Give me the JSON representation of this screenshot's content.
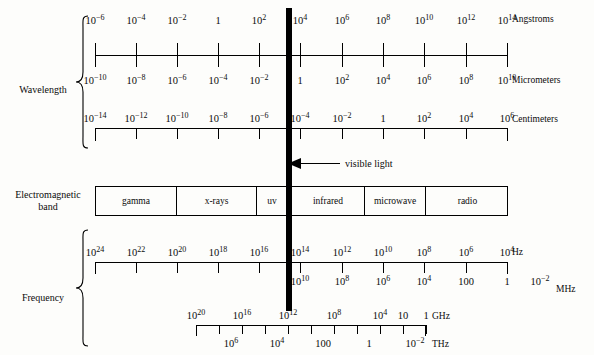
{
  "groups": {
    "wavelength_label": "Wavelength",
    "frequency_label": "Frequency",
    "band_label_line1": "Electromagnetic",
    "band_label_line2": "band"
  },
  "annotation": {
    "visible_light": "visible light",
    "arrow_icon": "left-arrow-icon"
  },
  "units": {
    "angstroms": "Angstroms",
    "micrometers": "Micrometers",
    "centimeters": "Centimeters",
    "hz": "Hz",
    "mhz": "MHz",
    "ghz": "GHz",
    "thz": "THz"
  },
  "scales": {
    "angstroms": {
      "unit": "Angstroms",
      "position": "above",
      "labels": [
        "10-6",
        "10-4",
        "10-2",
        "1",
        "102",
        "104",
        "106",
        "108",
        "1010",
        "1012",
        "1014"
      ],
      "exponents": [
        -6,
        -4,
        -2,
        0,
        2,
        4,
        6,
        8,
        10,
        12,
        14
      ]
    },
    "micrometers": {
      "unit": "Micrometers",
      "position": "below",
      "labels": [
        "10-10",
        "10-8",
        "10-6",
        "10-4",
        "10-2",
        "1",
        "102",
        "104",
        "106",
        "108",
        "1010"
      ],
      "exponents": [
        -10,
        -8,
        -6,
        -4,
        -2,
        0,
        2,
        4,
        6,
        8,
        10
      ]
    },
    "centimeters": {
      "unit": "Centimeters",
      "position": "above",
      "labels": [
        "10-14",
        "10-12",
        "10-10",
        "10-8",
        "10-6",
        "10-4",
        "10-2",
        "1",
        "102",
        "104",
        "106"
      ],
      "exponents": [
        -14,
        -12,
        -10,
        -8,
        -6,
        -4,
        -2,
        0,
        2,
        4,
        6
      ]
    },
    "hz": {
      "unit": "Hz",
      "position": "above",
      "labels": [
        "1024",
        "1022",
        "1020",
        "1018",
        "1016",
        "1014",
        "1012",
        "1010",
        "108",
        "106",
        "104"
      ],
      "exponents": [
        24,
        22,
        20,
        18,
        16,
        14,
        12,
        10,
        8,
        6,
        4
      ]
    },
    "mhz": {
      "unit": "MHz",
      "position": "below",
      "labels": [
        "1018",
        "1016",
        "1014",
        "1012",
        "1010",
        "108",
        "106",
        "104",
        "100",
        "1",
        "10-2"
      ],
      "exponents": [
        18,
        16,
        14,
        12,
        10,
        8,
        6,
        4,
        2,
        0,
        -2
      ],
      "visible_from_index": 4
    },
    "ghz": {
      "unit": "GHz",
      "position": "above",
      "labels": [
        "1020",
        "1018",
        "1016",
        "1014",
        "1012",
        "1010",
        "108",
        "106",
        "104",
        "10",
        "1"
      ],
      "exponents": [
        20,
        18,
        16,
        14,
        12,
        10,
        8,
        6,
        4,
        1,
        0
      ]
    },
    "thz": {
      "unit": "THz",
      "position": "below",
      "labels": [
        "108",
        "106",
        "104",
        "102",
        "100",
        "1",
        "10-2"
      ],
      "exponents": [
        8,
        6,
        4,
        2,
        0,
        -1,
        -2
      ]
    }
  },
  "bands": [
    {
      "name": "gamma",
      "label": "gamma"
    },
    {
      "name": "x-rays",
      "label": "x-rays"
    },
    {
      "name": "uv",
      "label": "uv"
    },
    {
      "name": "infrared",
      "label": "infrared"
    },
    {
      "name": "microwave",
      "label": "microwave"
    },
    {
      "name": "radio",
      "label": "radio"
    }
  ],
  "ticks": {
    "angstroms_row": [
      {
        "x": 95,
        "label": "10-6",
        "below": "10-10"
      },
      {
        "x": 136,
        "label": "10-4",
        "below": "10-8"
      },
      {
        "x": 177,
        "label": "10-2",
        "below": "10-6"
      },
      {
        "x": 218,
        "label": "1",
        "below": "10-4"
      },
      {
        "x": 259,
        "label": "102",
        "below": "10-2"
      },
      {
        "x": 300,
        "label": "104",
        "below": "1"
      },
      {
        "x": 342,
        "label": "106",
        "below": "102"
      },
      {
        "x": 383,
        "label": "108",
        "below": "104"
      },
      {
        "x": 424,
        "label": "1010",
        "below": "106"
      },
      {
        "x": 466,
        "label": "1012",
        "below": "108"
      },
      {
        "x": 507,
        "label": "1014",
        "below": "1010"
      }
    ],
    "centimeters_row": [
      {
        "x": 95,
        "label": "10-14"
      },
      {
        "x": 136,
        "label": "10-12"
      },
      {
        "x": 177,
        "label": "10-10"
      },
      {
        "x": 218,
        "label": "10-8"
      },
      {
        "x": 259,
        "label": "10-6"
      },
      {
        "x": 300,
        "label": "10-4"
      },
      {
        "x": 342,
        "label": "10-2"
      },
      {
        "x": 383,
        "label": "1"
      },
      {
        "x": 424,
        "label": "102"
      },
      {
        "x": 466,
        "label": "104"
      },
      {
        "x": 507,
        "label": "106"
      }
    ],
    "hz_row": [
      {
        "x": 95,
        "label": "1024",
        "below": ""
      },
      {
        "x": 136,
        "label": "1022",
        "below": ""
      },
      {
        "x": 177,
        "label": "1020",
        "below": ""
      },
      {
        "x": 218,
        "label": "1018",
        "below": ""
      },
      {
        "x": 259,
        "label": "1016",
        "below": ""
      },
      {
        "x": 300,
        "label": "1014",
        "below": "1010"
      },
      {
        "x": 342,
        "label": "1012",
        "below": "108"
      },
      {
        "x": 383,
        "label": "1010",
        "below": "106"
      },
      {
        "x": 424,
        "label": "108",
        "below": "104"
      },
      {
        "x": 466,
        "label": "106",
        "below": "100"
      },
      {
        "x": 507,
        "label": "104",
        "below": "1"
      }
    ],
    "mhz_extra": {
      "x": 540,
      "label": "10-2"
    },
    "ghz_row": [
      {
        "x": 196,
        "label": "1020",
        "below": ""
      },
      {
        "x": 219,
        "label": "1018",
        "below": "106"
      },
      {
        "x": 242,
        "label": "1016",
        "below": ""
      },
      {
        "x": 265,
        "label": "1014",
        "below": "104"
      },
      {
        "x": 288,
        "label": "1012",
        "below": ""
      },
      {
        "x": 311,
        "label": "1010",
        "below": "100"
      },
      {
        "x": 334,
        "label": "108",
        "below": ""
      },
      {
        "x": 357,
        "label": "106",
        "below": "1"
      },
      {
        "x": 380,
        "label": "104",
        "below": ""
      },
      {
        "x": 403,
        "label": "10",
        "below": "10-2"
      },
      {
        "x": 426,
        "label": "1",
        "below": ""
      }
    ]
  },
  "colors": {
    "ink": "#000000",
    "paper": "#fdfdfb",
    "visible_bar": "#000000"
  }
}
